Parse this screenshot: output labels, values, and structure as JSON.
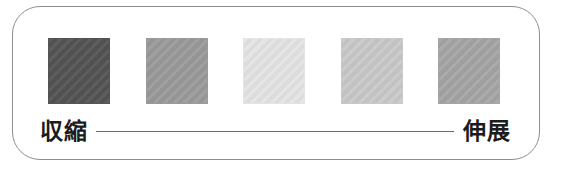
{
  "figure": {
    "type": "grayscale-gradient-scale",
    "frame_border_color": "#8e8e8e",
    "background_color": "#ffffff",
    "axis_line_color": "#6b6b6b",
    "label_color": "#1c1c1c"
  },
  "scale": {
    "left_label": "収縮",
    "right_label": "伸展",
    "connector": "line"
  },
  "swatches": [
    {
      "index": 1,
      "color": "#545454",
      "name": "swatch-1"
    },
    {
      "index": 2,
      "color": "#9a9a9a",
      "name": "swatch-2"
    },
    {
      "index": 3,
      "color": "#e4e4e4",
      "name": "swatch-3"
    },
    {
      "index": 4,
      "color": "#c9c9c9",
      "name": "swatch-4"
    },
    {
      "index": 5,
      "color": "#a5a5a5",
      "name": "swatch-5"
    }
  ],
  "chart_data": {
    "type": "heatmap",
    "title": "",
    "subtitle": "",
    "xlabel": "",
    "ylabel": "",
    "categories": [
      "1",
      "2",
      "3",
      "4",
      "5"
    ],
    "values": [
      0.33,
      0.6,
      0.89,
      0.79,
      0.65
    ],
    "value_description": "relative grayscale lightness of each swatch (0 = black, 1 = white)",
    "colors": [
      "#545454",
      "#9a9a9a",
      "#e4e4e4",
      "#c9c9c9",
      "#a5a5a5"
    ],
    "axis_endpoints": [
      "収縮",
      "伸展"
    ],
    "grid": false,
    "legend_position": "none",
    "annotations": [
      "収縮",
      "伸展"
    ]
  }
}
